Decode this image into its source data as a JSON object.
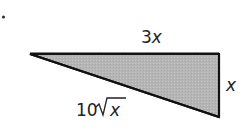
{
  "diagram": {
    "shape": "right-triangle",
    "fill_color": "#b8b8b8",
    "stroke_color": "#1a1a1a",
    "bullet": "•",
    "labels": {
      "top_coef": "3",
      "top_var": "x",
      "right_var": "x",
      "hyp_coef": "10",
      "hyp_radical": "√",
      "hyp_var": "x"
    },
    "sides": {
      "top": "3x",
      "right": "x",
      "hypotenuse": "10√x"
    }
  }
}
